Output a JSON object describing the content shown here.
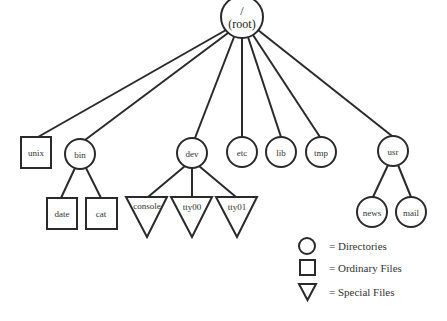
{
  "diagram": {
    "root": {
      "line1": "/",
      "line2": "(root)"
    },
    "nodes": {
      "unix": "unix",
      "bin": "bin",
      "dev": "dev",
      "etc": "etc",
      "lib": "lib",
      "tmp": "tmp",
      "usr": "usr",
      "date": "date",
      "cat": "cat",
      "console": "console",
      "tty00": "tty00",
      "tty01": "tty01",
      "news": "news",
      "mail": "mail"
    },
    "node_types": {
      "unix": "ordinary-file",
      "bin": "directory",
      "dev": "directory",
      "etc": "directory",
      "lib": "directory",
      "tmp": "directory",
      "usr": "directory",
      "date": "ordinary-file",
      "cat": "ordinary-file",
      "console": "special-file",
      "tty00": "special-file",
      "tty01": "special-file",
      "news": "directory",
      "mail": "directory"
    },
    "edges": [
      [
        "root",
        "unix"
      ],
      [
        "root",
        "bin"
      ],
      [
        "root",
        "dev"
      ],
      [
        "root",
        "etc"
      ],
      [
        "root",
        "lib"
      ],
      [
        "root",
        "tmp"
      ],
      [
        "root",
        "usr"
      ],
      [
        "bin",
        "date"
      ],
      [
        "bin",
        "cat"
      ],
      [
        "dev",
        "console"
      ],
      [
        "dev",
        "tty00"
      ],
      [
        "dev",
        "tty01"
      ],
      [
        "usr",
        "news"
      ],
      [
        "usr",
        "mail"
      ]
    ]
  },
  "legend": {
    "directories": "= Directories",
    "ordinary_files": "= Ordinary Files",
    "special_files": "= Special Files"
  },
  "colors": {
    "stroke": "#2a2a2a",
    "background": "#ffffff",
    "text": "#333333"
  }
}
